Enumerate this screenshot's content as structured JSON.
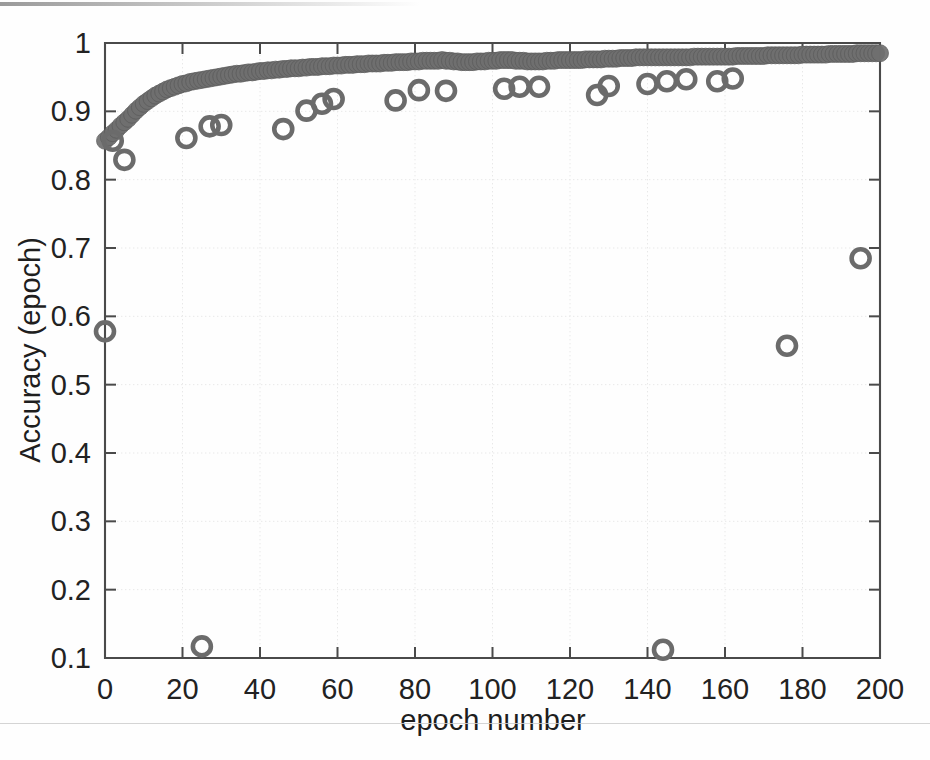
{
  "chart_data": {
    "type": "scatter",
    "title": "",
    "xlabel": "epoch number",
    "ylabel": "Accuracy (epoch)",
    "xlim": [
      0,
      200
    ],
    "ylim": [
      0.1,
      1.0
    ],
    "xticks": [
      0,
      20,
      40,
      60,
      80,
      100,
      120,
      140,
      160,
      180,
      200
    ],
    "xtick_labels": [
      "0",
      "20",
      "40",
      "60",
      "80",
      "100",
      "120",
      "140",
      "160",
      "180",
      "200"
    ],
    "yticks": [
      0.1,
      0.2,
      0.3,
      0.4,
      0.5,
      0.6,
      0.7,
      0.8,
      0.9,
      1.0
    ],
    "ytick_labels": [
      "0.1",
      "0.2",
      "0.3",
      "0.4",
      "0.5",
      "0.6",
      "0.7",
      "0.8",
      "0.9",
      "1"
    ],
    "grid": true,
    "legend": "none",
    "marker_color": "#6f6f6f",
    "series": [
      {
        "name": "training-accuracy",
        "marker": "filled-circle-dense",
        "points": [
          [
            0,
            0.857
          ],
          [
            1,
            0.862
          ],
          [
            2,
            0.868
          ],
          [
            3,
            0.873
          ],
          [
            4,
            0.879
          ],
          [
            5,
            0.884
          ],
          [
            6,
            0.889
          ],
          [
            7,
            0.895
          ],
          [
            8,
            0.901
          ],
          [
            9,
            0.906
          ],
          [
            10,
            0.911
          ],
          [
            11,
            0.915
          ],
          [
            12,
            0.919
          ],
          [
            13,
            0.923
          ],
          [
            14,
            0.926
          ],
          [
            15,
            0.929
          ],
          [
            16,
            0.932
          ],
          [
            17,
            0.934
          ],
          [
            18,
            0.936
          ],
          [
            19,
            0.938
          ],
          [
            20,
            0.94
          ],
          [
            21,
            0.941
          ],
          [
            22,
            0.943
          ],
          [
            23,
            0.944
          ],
          [
            24,
            0.945
          ],
          [
            25,
            0.946
          ],
          [
            26,
            0.947
          ],
          [
            27,
            0.948
          ],
          [
            28,
            0.949
          ],
          [
            29,
            0.95
          ],
          [
            30,
            0.951
          ],
          [
            31,
            0.952
          ],
          [
            32,
            0.953
          ],
          [
            33,
            0.954
          ],
          [
            34,
            0.955
          ],
          [
            35,
            0.955
          ],
          [
            36,
            0.956
          ],
          [
            37,
            0.957
          ],
          [
            38,
            0.957
          ],
          [
            39,
            0.958
          ],
          [
            40,
            0.959
          ],
          [
            41,
            0.959
          ],
          [
            42,
            0.96
          ],
          [
            43,
            0.96
          ],
          [
            44,
            0.961
          ],
          [
            45,
            0.961
          ],
          [
            46,
            0.962
          ],
          [
            47,
            0.962
          ],
          [
            48,
            0.963
          ],
          [
            49,
            0.963
          ],
          [
            50,
            0.963
          ],
          [
            51,
            0.964
          ],
          [
            52,
            0.964
          ],
          [
            53,
            0.965
          ],
          [
            54,
            0.965
          ],
          [
            55,
            0.965
          ],
          [
            56,
            0.966
          ],
          [
            57,
            0.966
          ],
          [
            58,
            0.966
          ],
          [
            59,
            0.967
          ],
          [
            60,
            0.967
          ],
          [
            61,
            0.967
          ],
          [
            62,
            0.968
          ],
          [
            63,
            0.968
          ],
          [
            64,
            0.968
          ],
          [
            65,
            0.969
          ],
          [
            66,
            0.969
          ],
          [
            67,
            0.969
          ],
          [
            68,
            0.97
          ],
          [
            69,
            0.97
          ],
          [
            70,
            0.97
          ],
          [
            71,
            0.97
          ],
          [
            72,
            0.971
          ],
          [
            73,
            0.971
          ],
          [
            74,
            0.971
          ],
          [
            75,
            0.972
          ],
          [
            76,
            0.972
          ],
          [
            77,
            0.972
          ],
          [
            78,
            0.972
          ],
          [
            79,
            0.973
          ],
          [
            80,
            0.973
          ],
          [
            81,
            0.973
          ],
          [
            82,
            0.974
          ],
          [
            83,
            0.974
          ],
          [
            84,
            0.974
          ],
          [
            85,
            0.974
          ],
          [
            86,
            0.974
          ],
          [
            87,
            0.975
          ],
          [
            88,
            0.974
          ],
          [
            89,
            0.974
          ],
          [
            90,
            0.973
          ],
          [
            91,
            0.973
          ],
          [
            92,
            0.972
          ],
          [
            93,
            0.972
          ],
          [
            94,
            0.972
          ],
          [
            95,
            0.972
          ],
          [
            96,
            0.973
          ],
          [
            97,
            0.973
          ],
          [
            98,
            0.973
          ],
          [
            99,
            0.974
          ],
          [
            100,
            0.974
          ],
          [
            101,
            0.974
          ],
          [
            102,
            0.975
          ],
          [
            103,
            0.975
          ],
          [
            104,
            0.975
          ],
          [
            105,
            0.975
          ],
          [
            106,
            0.974
          ],
          [
            107,
            0.974
          ],
          [
            108,
            0.974
          ],
          [
            109,
            0.973
          ],
          [
            110,
            0.973
          ],
          [
            111,
            0.973
          ],
          [
            112,
            0.973
          ],
          [
            113,
            0.973
          ],
          [
            114,
            0.974
          ],
          [
            115,
            0.974
          ],
          [
            116,
            0.974
          ],
          [
            117,
            0.975
          ],
          [
            118,
            0.975
          ],
          [
            119,
            0.975
          ],
          [
            120,
            0.975
          ],
          [
            121,
            0.975
          ],
          [
            122,
            0.975
          ],
          [
            123,
            0.975
          ],
          [
            124,
            0.976
          ],
          [
            125,
            0.976
          ],
          [
            126,
            0.976
          ],
          [
            127,
            0.976
          ],
          [
            128,
            0.976
          ],
          [
            129,
            0.977
          ],
          [
            130,
            0.977
          ],
          [
            131,
            0.977
          ],
          [
            132,
            0.977
          ],
          [
            133,
            0.978
          ],
          [
            134,
            0.978
          ],
          [
            135,
            0.978
          ],
          [
            136,
            0.978
          ],
          [
            137,
            0.979
          ],
          [
            138,
            0.979
          ],
          [
            139,
            0.979
          ],
          [
            140,
            0.979
          ],
          [
            141,
            0.979
          ],
          [
            142,
            0.979
          ],
          [
            143,
            0.979
          ],
          [
            144,
            0.979
          ],
          [
            145,
            0.979
          ],
          [
            146,
            0.979
          ],
          [
            147,
            0.979
          ],
          [
            148,
            0.979
          ],
          [
            149,
            0.979
          ],
          [
            150,
            0.979
          ],
          [
            151,
            0.979
          ],
          [
            152,
            0.98
          ],
          [
            153,
            0.98
          ],
          [
            154,
            0.98
          ],
          [
            155,
            0.98
          ],
          [
            156,
            0.98
          ],
          [
            157,
            0.98
          ],
          [
            158,
            0.98
          ],
          [
            159,
            0.98
          ],
          [
            160,
            0.98
          ],
          [
            161,
            0.98
          ],
          [
            162,
            0.98
          ],
          [
            163,
            0.981
          ],
          [
            164,
            0.981
          ],
          [
            165,
            0.981
          ],
          [
            166,
            0.981
          ],
          [
            167,
            0.981
          ],
          [
            168,
            0.981
          ],
          [
            169,
            0.981
          ],
          [
            170,
            0.981
          ],
          [
            171,
            0.982
          ],
          [
            172,
            0.982
          ],
          [
            173,
            0.982
          ],
          [
            174,
            0.982
          ],
          [
            175,
            0.982
          ],
          [
            176,
            0.982
          ],
          [
            177,
            0.982
          ],
          [
            178,
            0.982
          ],
          [
            179,
            0.982
          ],
          [
            180,
            0.983
          ],
          [
            181,
            0.983
          ],
          [
            182,
            0.983
          ],
          [
            183,
            0.983
          ],
          [
            184,
            0.983
          ],
          [
            185,
            0.983
          ],
          [
            186,
            0.983
          ],
          [
            187,
            0.984
          ],
          [
            188,
            0.984
          ],
          [
            189,
            0.984
          ],
          [
            190,
            0.984
          ],
          [
            191,
            0.984
          ],
          [
            192,
            0.984
          ],
          [
            193,
            0.984
          ],
          [
            194,
            0.985
          ],
          [
            195,
            0.985
          ],
          [
            196,
            0.985
          ],
          [
            197,
            0.985
          ],
          [
            198,
            0.985
          ],
          [
            199,
            0.985
          ],
          [
            200,
            0.985
          ]
        ]
      },
      {
        "name": "validation-accuracy",
        "marker": "open-circle",
        "points": [
          [
            0,
            0.578
          ],
          [
            2,
            0.857
          ],
          [
            5,
            0.829
          ],
          [
            21,
            0.861
          ],
          [
            25,
            0.117
          ],
          [
            27,
            0.878
          ],
          [
            30,
            0.88
          ],
          [
            46,
            0.874
          ],
          [
            52,
            0.901
          ],
          [
            56,
            0.911
          ],
          [
            59,
            0.918
          ],
          [
            75,
            0.916
          ],
          [
            81,
            0.931
          ],
          [
            88,
            0.93
          ],
          [
            103,
            0.933
          ],
          [
            107,
            0.936
          ],
          [
            112,
            0.936
          ],
          [
            127,
            0.924
          ],
          [
            130,
            0.937
          ],
          [
            140,
            0.94
          ],
          [
            144,
            0.112
          ],
          [
            145,
            0.944
          ],
          [
            150,
            0.947
          ],
          [
            158,
            0.944
          ],
          [
            162,
            0.948
          ],
          [
            176,
            0.557
          ],
          [
            195,
            0.685
          ]
        ]
      }
    ]
  },
  "axes": {
    "plot_left": 105,
    "plot_right": 880,
    "plot_top": 43,
    "plot_bottom": 658
  }
}
